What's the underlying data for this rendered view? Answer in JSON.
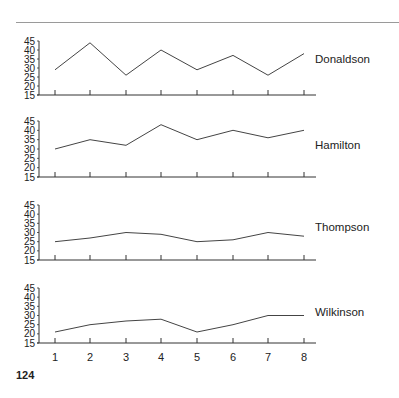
{
  "page": {
    "page_number": "124"
  },
  "chart_data": {
    "type": "line",
    "layout": "small-multiples",
    "title": "",
    "xlabel": "",
    "ylabel": "",
    "x": [
      1,
      2,
      3,
      4,
      5,
      6,
      7,
      8
    ],
    "x_tick_labels": [
      "1",
      "2",
      "3",
      "4",
      "5",
      "6",
      "7",
      "8"
    ],
    "y_tick_labels": [
      "45",
      "40",
      "35",
      "30",
      "25",
      "20",
      "15"
    ],
    "ylim": [
      15,
      45
    ],
    "grid": false,
    "legend": "direct-labels-right",
    "series": [
      {
        "name": "Donaldson",
        "values": [
          29,
          44,
          26,
          40,
          29,
          37,
          26,
          38
        ]
      },
      {
        "name": "Hamilton",
        "values": [
          30,
          35,
          32,
          43,
          35,
          40,
          36,
          40
        ]
      },
      {
        "name": "Thompson",
        "values": [
          25,
          27,
          30,
          29,
          25,
          26,
          30,
          28
        ]
      },
      {
        "name": "Wilkinson",
        "values": [
          21,
          25,
          27,
          28,
          21,
          25,
          30,
          30
        ]
      }
    ],
    "colors": {
      "line": "#444444",
      "axis": "#333333",
      "text": "#222222"
    }
  }
}
